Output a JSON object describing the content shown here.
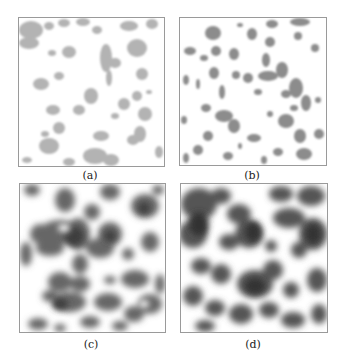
{
  "figure": {
    "panels": [
      {
        "id": "a",
        "label": "(a)",
        "density": "sparse",
        "tone": "#b8b8b8"
      },
      {
        "id": "b",
        "label": "(b)",
        "density": "sparse-darker",
        "tone": "#8a8a8a"
      },
      {
        "id": "c",
        "label": "(c)",
        "density": "dense",
        "tone": "#5a5a5a"
      },
      {
        "id": "d",
        "label": "(d)",
        "density": "very-dense",
        "tone": "#444444"
      }
    ]
  }
}
